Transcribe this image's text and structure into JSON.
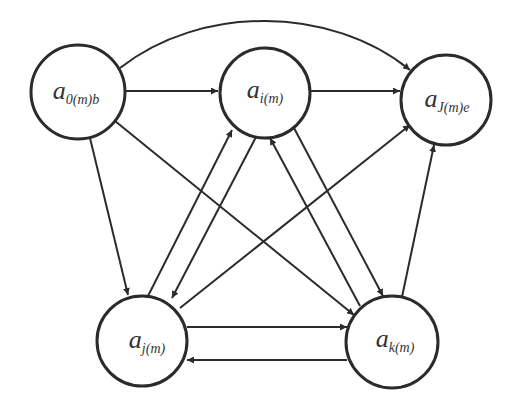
{
  "figure": {
    "type": "directed-graph",
    "stroke_color": "#2b2b2b",
    "background": "#ffffff"
  },
  "nodes": [
    {
      "id": "a0",
      "label_main": "a",
      "label_sub": "0(m)b",
      "cx": 78,
      "cy": 92,
      "r": 47
    },
    {
      "id": "ai",
      "label_main": "a",
      "label_sub": "i(m)",
      "cx": 265,
      "cy": 93,
      "r": 45
    },
    {
      "id": "aJ",
      "label_main": "a",
      "label_sub": "J(m)e",
      "cx": 446,
      "cy": 100,
      "r": 45
    },
    {
      "id": "aj",
      "label_main": "a",
      "label_sub": "j(m)",
      "cx": 142,
      "cy": 341,
      "r": 45
    },
    {
      "id": "ak",
      "label_main": "a",
      "label_sub": "k(m)",
      "cx": 392,
      "cy": 342,
      "r": 46
    }
  ],
  "edges": [
    {
      "from": "a0",
      "to": "ai",
      "shape": "straight"
    },
    {
      "from": "a0",
      "to": "aJ",
      "shape": "arc"
    },
    {
      "from": "a0",
      "to": "aj",
      "shape": "straight"
    },
    {
      "from": "a0",
      "to": "ak",
      "shape": "straight"
    },
    {
      "from": "ai",
      "to": "aJ",
      "shape": "straight"
    },
    {
      "from": "ai",
      "to": "aj",
      "shape": "straight"
    },
    {
      "from": "aj",
      "to": "ai",
      "shape": "straight"
    },
    {
      "from": "ai",
      "to": "ak",
      "shape": "straight"
    },
    {
      "from": "ak",
      "to": "ai",
      "shape": "straight"
    },
    {
      "from": "aj",
      "to": "aJ",
      "shape": "straight"
    },
    {
      "from": "aj",
      "to": "ak",
      "shape": "straight"
    },
    {
      "from": "ak",
      "to": "aj",
      "shape": "straight"
    },
    {
      "from": "ak",
      "to": "aJ",
      "shape": "straight"
    }
  ]
}
